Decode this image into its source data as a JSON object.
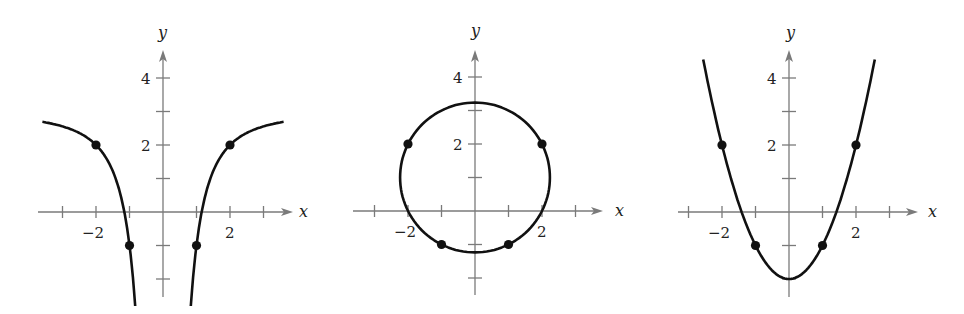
{
  "chart_data": [
    {
      "type": "line",
      "title": "",
      "equation": "y = 3 - 4/x^2",
      "xlabel": "x",
      "ylabel": "y",
      "x_tick_labels": [
        {
          "value": -2,
          "label": "−2"
        },
        {
          "value": 2,
          "label": "2"
        }
      ],
      "y_tick_labels": [
        {
          "value": 4,
          "label": "4"
        },
        {
          "value": 2,
          "label": "2"
        }
      ],
      "x_ticks": [
        -3,
        -2,
        -1,
        1,
        2,
        3
      ],
      "y_ticks": [
        -2,
        -1,
        1,
        2,
        3,
        4
      ],
      "xlim": [
        -3.1,
        3.9
      ],
      "ylim": [
        -2.5,
        4.8
      ],
      "grid": false,
      "series": [
        {
          "name": "left branch",
          "x_range": [
            -3.6,
            -0.83
          ]
        },
        {
          "name": "right branch",
          "x_range": [
            0.83,
            3.6
          ]
        }
      ],
      "points": [
        [
          -2,
          2
        ],
        [
          -1,
          -1
        ],
        [
          1,
          -1
        ],
        [
          2,
          2
        ]
      ]
    },
    {
      "type": "line",
      "title": "",
      "equation": "x^2 + (y - 1)^2 = 5",
      "xlabel": "x",
      "ylabel": "y",
      "x_tick_labels": [
        {
          "value": -2,
          "label": "−2"
        },
        {
          "value": 2,
          "label": "2"
        }
      ],
      "y_tick_labels": [
        {
          "value": 4,
          "label": "4"
        },
        {
          "value": 2,
          "label": "2"
        }
      ],
      "x_ticks": [
        -3,
        -2,
        -1,
        1,
        2,
        3
      ],
      "y_ticks": [
        -2,
        -1,
        1,
        2,
        3,
        4
      ],
      "grid": false,
      "circle": {
        "center": [
          0,
          1
        ],
        "radius": 2.236
      },
      "points": [
        [
          -2,
          2
        ],
        [
          2,
          2
        ],
        [
          -1,
          -1
        ],
        [
          1,
          -1
        ]
      ]
    },
    {
      "type": "line",
      "title": "",
      "equation": "y = x^2 - 2",
      "xlabel": "x",
      "ylabel": "y",
      "x_tick_labels": [
        {
          "value": -2,
          "label": "−2"
        },
        {
          "value": 2,
          "label": "2"
        }
      ],
      "y_tick_labels": [
        {
          "value": 4,
          "label": "4"
        },
        {
          "value": 2,
          "label": "2"
        }
      ],
      "x_ticks": [
        -3,
        -2,
        -1,
        1,
        2,
        3
      ],
      "y_ticks": [
        -2,
        -1,
        1,
        2,
        3,
        4
      ],
      "grid": false,
      "series": [
        {
          "name": "parabola",
          "x_range": [
            -2.56,
            2.56
          ]
        }
      ],
      "points": [
        [
          -2,
          2
        ],
        [
          -1,
          -1
        ],
        [
          1,
          -1
        ],
        [
          2,
          2
        ]
      ]
    }
  ],
  "layout": {
    "graphs": [
      {
        "origin": [
          163,
          212
        ],
        "unit": 33.5,
        "x_axis": [
          38,
          293
        ],
        "y_axis": [
          297,
          50
        ],
        "x_label_pos": [
          303,
          217
        ],
        "y_label_pos": [
          162,
          38
        ]
      },
      {
        "origin": [
          475,
          211
        ],
        "unit": 33.5,
        "x_axis": [
          353,
          603
        ],
        "y_axis": [
          295,
          50
        ],
        "x_label_pos": [
          619,
          216
        ],
        "y_label_pos": [
          475,
          36
        ]
      },
      {
        "origin": [
          789,
          212
        ],
        "unit": 33.5,
        "x_axis": [
          678,
          918
        ],
        "y_axis": [
          297,
          50
        ],
        "x_label_pos": [
          932,
          217
        ],
        "y_label_pos": [
          790,
          38
        ]
      }
    ]
  },
  "colors": {
    "curve": "#111111",
    "axis": "#7a7a7a",
    "text": "#222222"
  }
}
